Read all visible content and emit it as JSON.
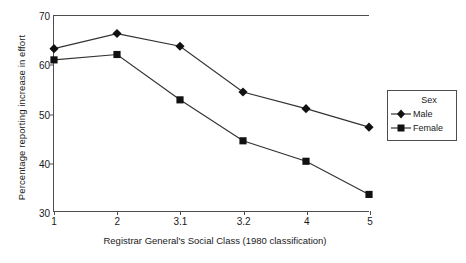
{
  "chart_data": {
    "type": "line",
    "title": "",
    "xlabel": "Registrar General's Social Class (1980 classification)",
    "ylabel": "Percentage reporting increase in effort",
    "categories": [
      "1",
      "2",
      "3.1",
      "3.2",
      "4",
      "5"
    ],
    "series": [
      {
        "name": "Male",
        "marker": "diamond",
        "values": [
          63.3,
          66.4,
          63.8,
          54.4,
          51.0,
          47.2
        ]
      },
      {
        "name": "Female",
        "marker": "square",
        "values": [
          61.0,
          62.1,
          52.8,
          44.4,
          40.2,
          33.4
        ]
      }
    ],
    "ylim": [
      30,
      70
    ],
    "yticks": [
      "30",
      "40",
      "50",
      "60",
      "70"
    ],
    "grid": false,
    "legend": {
      "title": "Sex",
      "position": "right"
    },
    "line_color": "#333333",
    "marker_color": "#111111",
    "axis_color": "#4d4d4d"
  },
  "legend": {
    "title": "Sex",
    "entries": [
      {
        "label": "Male"
      },
      {
        "label": "Female"
      }
    ]
  }
}
